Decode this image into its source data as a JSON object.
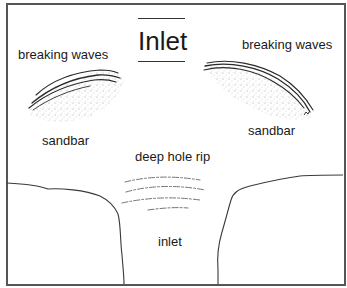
{
  "diagram": {
    "title": "Inlet",
    "labels": {
      "breaking_waves_left": "breaking waves",
      "breaking_waves_right": "breaking waves",
      "sandbar_left": "sandbar",
      "sandbar_right": "sandbar",
      "deep_hole_rip": "deep hole rip",
      "inlet": "inlet"
    },
    "colors": {
      "frame": "#555555",
      "line": "#333333",
      "stipple": "#888888",
      "text": "#1a1a1a",
      "background": "#ffffff"
    }
  }
}
